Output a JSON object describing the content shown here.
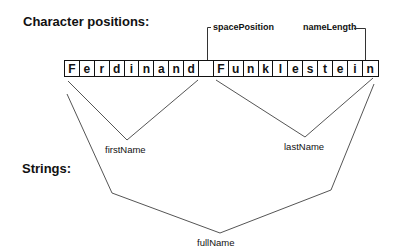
{
  "headings": {
    "character_positions": "Character positions:",
    "strings": "Strings:"
  },
  "markers": {
    "space_position": "spacePosition",
    "name_length": "nameLength"
  },
  "characters": [
    "F",
    "e",
    "r",
    "d",
    "i",
    "n",
    "a",
    "n",
    "d",
    " ",
    "F",
    "u",
    "n",
    "k",
    "l",
    "e",
    "s",
    "t",
    "e",
    "i",
    "n"
  ],
  "substrings": {
    "first_name": "firstName",
    "last_name": "lastName",
    "full_name": "fullName"
  },
  "colors": {
    "ink": "#111111",
    "line": "#555555",
    "background": "#ffffff"
  }
}
